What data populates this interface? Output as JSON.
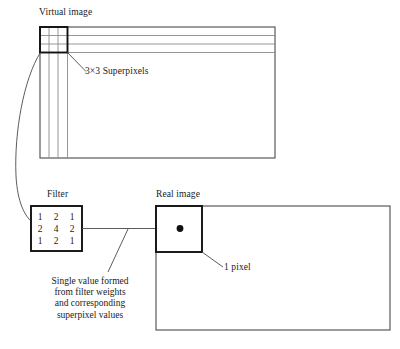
{
  "figure": {
    "title_labels": {
      "virtual_image": "Virtual image",
      "superpixels": "3×3 Superpixels",
      "filter": "Filter",
      "real_image": "Real image",
      "one_pixel": "1 pixel"
    },
    "caption": {
      "line1": "Single value formed",
      "line2": "from filter weights",
      "line3": "and corresponding",
      "line4": "superpixel values"
    },
    "filter_kernel": {
      "rows": [
        [
          "1",
          "2",
          "1"
        ],
        [
          "2",
          "4",
          "2"
        ],
        [
          "1",
          "2",
          "1"
        ]
      ]
    },
    "colors": {
      "stroke": "#4a4a4a",
      "bold_stroke": "#1a1a1a",
      "grid_line": "#8a8a8a",
      "background": "#ffffff",
      "dot": "#111111"
    }
  }
}
